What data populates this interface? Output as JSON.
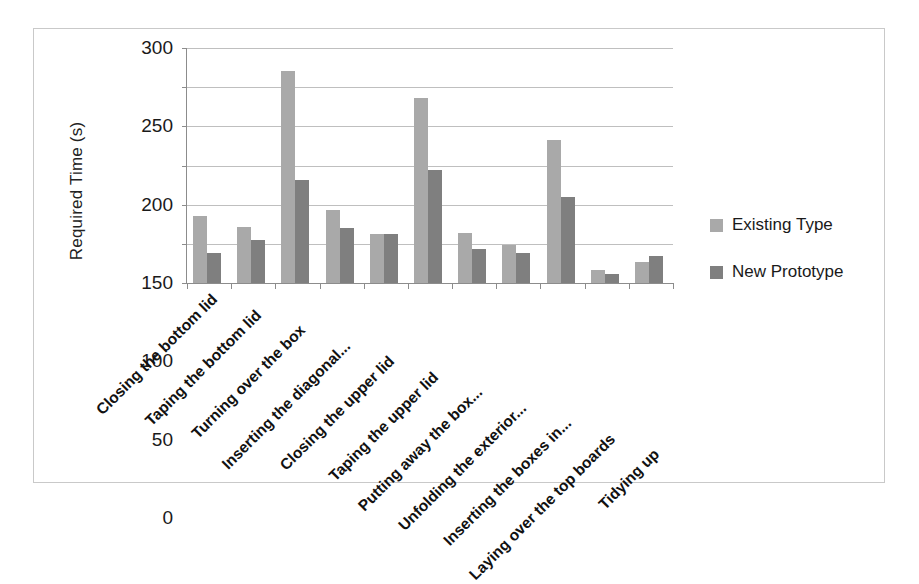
{
  "chart_data": {
    "type": "bar",
    "title": "",
    "xlabel": "",
    "ylabel": "Required Time (s)",
    "ylim": [
      0,
      300
    ],
    "ytick_interval": 50,
    "yticks": [
      300,
      250,
      200,
      150,
      100,
      50,
      0
    ],
    "grid": true,
    "legend_position": "right",
    "categories": [
      "Closing the bottom lid",
      "Taping the bottom lid",
      "Turning over the box",
      "Inserting the diagonal...",
      "Closing the upper lid",
      "Taping the upper lid",
      "Putting away the box...",
      "Unfolding the exterior...",
      "Inserting the boxes in...",
      "Laying over the top boards",
      "Tidying up"
    ],
    "series": [
      {
        "name": "Existing Type",
        "color": "#a9a9a9",
        "values": [
          85,
          71,
          271,
          93,
          62,
          236,
          64,
          48,
          183,
          17,
          27
        ]
      },
      {
        "name": "New Prototype",
        "color": "#7f7f7f",
        "values": [
          38,
          55,
          132,
          70,
          62,
          144,
          44,
          38,
          110,
          12,
          35
        ]
      }
    ]
  },
  "colors": {
    "series_existing": "#a9a9a9",
    "series_prototype": "#7f7f7f",
    "gridline": "#bfbfbf",
    "axis": "#8c8c8c",
    "frame_border": "#c9c9c9",
    "background": "#ffffff"
  }
}
